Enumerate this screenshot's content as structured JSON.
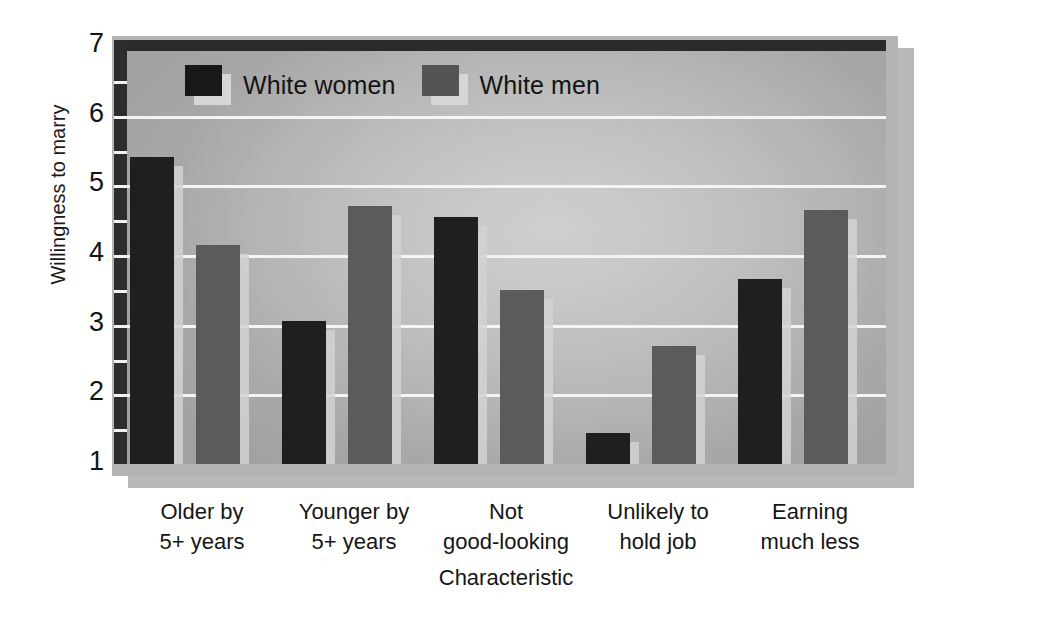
{
  "chart_data": {
    "type": "bar",
    "title": "",
    "xlabel": "Characteristic",
    "ylabel": "Willingness to marry",
    "ylim": [
      1,
      7
    ],
    "yticks": [
      7,
      6,
      5,
      4,
      3,
      2,
      1
    ],
    "grid": true,
    "legend_position": "top-left-inside",
    "categories": [
      "Older by\n5+ years",
      "Younger by\n5+ years",
      "Not\ngood-looking",
      "Unlikely to\nhold job",
      "Earning\nmuch less"
    ],
    "category_lines": [
      [
        "Older by",
        "5+ years"
      ],
      [
        "Younger by",
        "5+ years"
      ],
      [
        "Not",
        "good-looking"
      ],
      [
        "Unlikely to",
        "hold job"
      ],
      [
        "Earning",
        "much less"
      ]
    ],
    "series": [
      {
        "name": "White women",
        "color": "#1f1f1f",
        "values": [
          5.4,
          3.05,
          4.55,
          1.45,
          3.65
        ]
      },
      {
        "name": "White men",
        "color": "#5b5b5b",
        "values": [
          4.15,
          4.7,
          3.5,
          2.7,
          4.65
        ]
      }
    ]
  },
  "legend": {
    "items": [
      {
        "label": "White women",
        "swatch": "women"
      },
      {
        "label": "White men",
        "swatch": "men"
      }
    ]
  },
  "axes": {
    "y_title": "Willingness to marry",
    "x_title": "Characteristic"
  },
  "colors": {
    "series_women": "#1f1f1f",
    "series_men": "#5b5b5b",
    "plot_background": "#bdbdbd",
    "frame": "#b4b4b4",
    "gridline": "#f4f4f4",
    "axis_line": "#2a2a2a",
    "bar_shadow": "#d2d2d2"
  }
}
